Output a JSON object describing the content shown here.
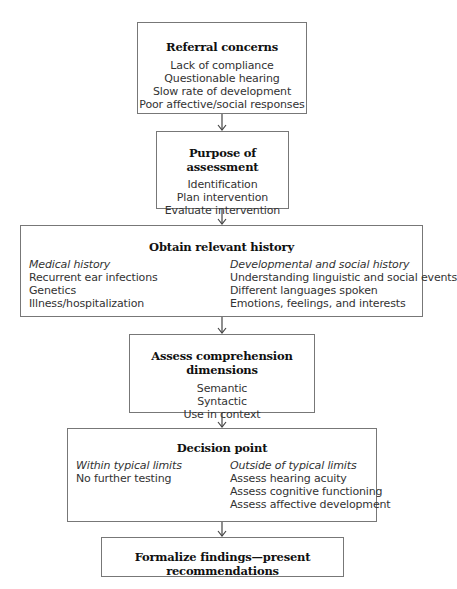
{
  "flowchart": {
    "referral": {
      "title": "Referral concerns",
      "items": [
        "Lack of compliance",
        "Questionable hearing",
        "Slow rate of development",
        "Poor affective/social responses"
      ]
    },
    "purpose": {
      "title": "Purpose of assessment",
      "items": [
        "Identification",
        "Plan intervention",
        "Evaluate intervention"
      ]
    },
    "history": {
      "title": "Obtain relevant history",
      "left": {
        "heading": "Medical history",
        "items": [
          "Recurrent ear infections",
          "Genetics",
          "Illness/hospitalization"
        ]
      },
      "right": {
        "heading": "Developmental and social history",
        "items": [
          "Understanding linguistic and social events",
          "Different languages spoken",
          "Emotions, feelings, and interests"
        ]
      }
    },
    "assess": {
      "title": "Assess comprehension dimensions",
      "items": [
        "Semantic",
        "Syntactic",
        "Use in context"
      ]
    },
    "decision": {
      "title": "Decision point",
      "left": {
        "heading": "Within typical limits",
        "items": [
          "No further testing"
        ]
      },
      "right": {
        "heading": "Outside of typical limits",
        "items": [
          "Assess hearing acuity",
          "Assess cognitive functioning",
          "Assess affective development"
        ]
      }
    },
    "formalize": {
      "title": "Formalize findings—present recommendations"
    },
    "connections": [
      {
        "from": "referral",
        "to": "purpose"
      },
      {
        "from": "purpose",
        "to": "history"
      },
      {
        "from": "history",
        "to": "assess"
      },
      {
        "from": "assess",
        "to": "decision"
      },
      {
        "from": "decision",
        "to": "formalize"
      }
    ]
  },
  "colors": {
    "border": "#777777",
    "text": "#333333",
    "title": "#111111",
    "arrow": "#444444"
  }
}
